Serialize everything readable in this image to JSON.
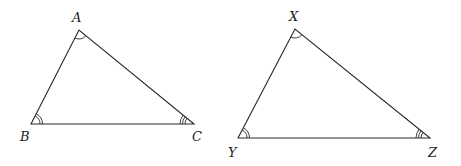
{
  "diagram": {
    "type": "similar-triangles",
    "stroke_color": "#2a2a2a",
    "background": "#ffffff",
    "triangles": [
      {
        "name": "ABC",
        "vertices": {
          "A": {
            "label": "A",
            "x": 79,
            "y": 30,
            "arcs": 1,
            "label_x": 72,
            "label_y": 22
          },
          "B": {
            "label": "B",
            "x": 31,
            "y": 124,
            "arcs": 2,
            "label_x": 20,
            "label_y": 141
          },
          "C": {
            "label": "C",
            "x": 194,
            "y": 124,
            "arcs": 3,
            "label_x": 192,
            "label_y": 141
          }
        }
      },
      {
        "name": "XYZ",
        "vertices": {
          "X": {
            "label": "X",
            "x": 295,
            "y": 29,
            "arcs": 1,
            "label_x": 289,
            "label_y": 21
          },
          "Y": {
            "label": "Y",
            "x": 238,
            "y": 138,
            "arcs": 2,
            "label_x": 228,
            "label_y": 157
          },
          "Z": {
            "label": "Z",
            "x": 430,
            "y": 138,
            "arcs": 3,
            "label_x": 428,
            "label_y": 157
          }
        }
      }
    ],
    "angle_correspondence": [
      {
        "angles": [
          "A",
          "X"
        ],
        "marks": "single arc"
      },
      {
        "angles": [
          "B",
          "Y"
        ],
        "marks": "double arc"
      },
      {
        "angles": [
          "C",
          "Z"
        ],
        "marks": "triple arc"
      }
    ]
  }
}
